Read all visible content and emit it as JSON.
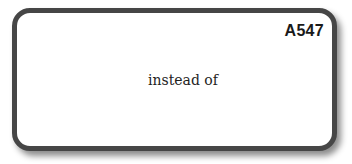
{
  "card": {
    "code": "A547",
    "phrase": "instead of",
    "border_color": "#464646",
    "background_color": "#ffffff"
  }
}
